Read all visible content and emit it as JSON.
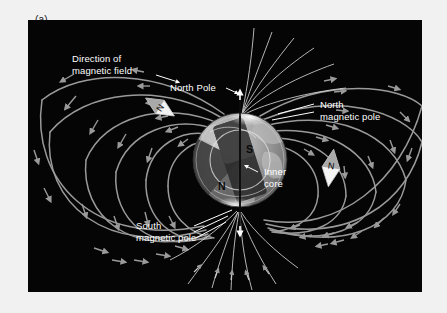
{
  "figure": {
    "panel_label": "(a)",
    "background_color": "#f1f1f1",
    "photo_background_color": "#050505",
    "field_line_color": "#9a9a9a",
    "label_text_color": "#ffffff",
    "globe_color": "#8e8e8e"
  },
  "labels": {
    "direction_of_field_line1": "Direction of",
    "direction_of_field_line2": "magnetic field",
    "north_pole": "North Pole",
    "north_magnetic_pole_line1": "North",
    "north_magnetic_pole_line2": "magnetic pole",
    "south_magnetic_pole_line1": "South",
    "south_magnetic_pole_line2": "magnetic pole",
    "inner_core_line1": "Inner",
    "inner_core_line2": "core"
  },
  "magnet": {
    "south_pole_mark": "S",
    "north_pole_mark": "N"
  },
  "compass": {
    "left_needle_mark": "N",
    "right_needle_mark": "N"
  },
  "diagram_data": {
    "type": "diagram",
    "subject": "Earth's magnetic field (dipole)",
    "globe": {
      "center_x": 212,
      "center_y": 140,
      "radius": 47,
      "cutaway": true,
      "internal_bar_magnet_tilt_deg": -18,
      "magnet_south_end": "top-right",
      "magnet_north_end": "bottom-left"
    },
    "rotation_axis": {
      "orientation": "vertical",
      "top_arrow": true,
      "bottom_arrow": true,
      "x": 212,
      "y_top": 76,
      "y_bottom": 208
    },
    "field_lines": {
      "count": 14,
      "arrowheads_per_line": 2,
      "flow_direction": "from south magnetic pole (bottom) around to north magnetic pole (top)",
      "color": "#9a9a9a"
    },
    "compass_needles": [
      {
        "id": "left",
        "x": 132,
        "y": 87,
        "rotation_deg": -58,
        "label": "N"
      },
      {
        "id": "right",
        "x": 303,
        "y": 148,
        "rotation_deg": 8,
        "label": "N"
      }
    ],
    "annotations": [
      {
        "name": "direction-of-magnetic-field",
        "leader_to": "field line (upper-left)"
      },
      {
        "name": "north-pole",
        "leader_to": "rotation axis top"
      },
      {
        "name": "north-magnetic-pole",
        "leader_to": "globe upper-right surface"
      },
      {
        "name": "south-magnetic-pole",
        "leader_to": "globe lower surface"
      },
      {
        "name": "inner-core",
        "leader_to": "globe interior"
      }
    ]
  }
}
